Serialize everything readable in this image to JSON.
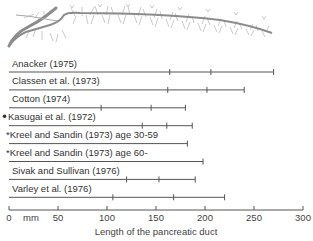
{
  "chart_data": {
    "type": "range-bar",
    "title": "",
    "xlabel": "Length of the pancreatic duct",
    "x_unit": "mm",
    "xlim": [
      0,
      300
    ],
    "x_ticks": [
      0,
      50,
      100,
      150,
      200,
      250,
      300
    ],
    "grid": false,
    "legend": null,
    "series": [
      {
        "name": "Anacker (1975)",
        "marker": "",
        "start": 0,
        "ticks": [
          164,
          206
        ],
        "end": 270
      },
      {
        "name": "Classen et al. (1973)",
        "marker": "",
        "start": 0,
        "ticks": [
          162,
          202
        ],
        "end": 240
      },
      {
        "name": "Cotton (1974)",
        "marker": "",
        "start": 0,
        "ticks": [
          94,
          145
        ],
        "end": 180
      },
      {
        "name": "Kasugai et al. (1972)",
        "marker": "•",
        "start": 0,
        "ticks": [
          136,
          161
        ],
        "end": 187
      },
      {
        "name": "Kreel and Sandin (1973) age 30-59",
        "marker": "*",
        "start": 0,
        "ticks": [],
        "end": 182
      },
      {
        "name": "Kreel and Sandin (1973) age 60-",
        "marker": "*",
        "start": 0,
        "ticks": [],
        "end": 198
      },
      {
        "name": "Sivak and Sullivan (1976)",
        "marker": "",
        "start": 0,
        "ticks": [
          120,
          153
        ],
        "end": 190
      },
      {
        "name": "Varley et al. (1976)",
        "marker": "",
        "start": 0,
        "ticks": [
          106,
          168
        ],
        "end": 220
      }
    ],
    "illustration": "pancreatic duct with branching side ducts"
  },
  "axis": {
    "unit_label": "mm",
    "title": "Length of the pancreatic duct",
    "tick_labels": [
      "0",
      "50",
      "100",
      "150",
      "200",
      "250",
      "300"
    ]
  },
  "rows": [
    {
      "label": "Anacker (1975)"
    },
    {
      "label": "Classen et al. (1973)"
    },
    {
      "label": "Cotton (1974)"
    },
    {
      "label": "Kasugai et al. (1972)"
    },
    {
      "label": "*Kreel and Sandin (1973) age 30-59"
    },
    {
      "label": "*Kreel and Sandin (1973) age 60-"
    },
    {
      "label": "Sivak and Sullivan (1976)"
    },
    {
      "label": "Varley et al. (1976)"
    }
  ],
  "colors": {
    "line": "#555555",
    "duct": "#8c8c8c",
    "branch": "#b5b5b5",
    "text": "#333333"
  }
}
